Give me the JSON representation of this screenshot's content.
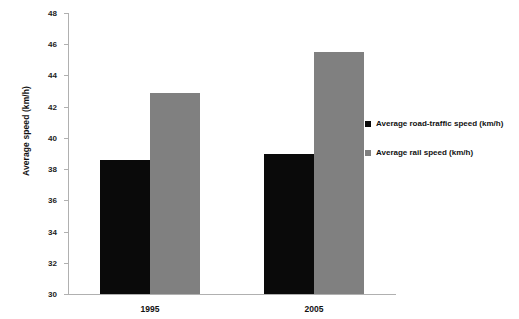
{
  "chart_data": {
    "type": "bar",
    "title": "",
    "xlabel": "",
    "ylabel": "Average speed (km/h)",
    "categories": [
      "1995",
      "2005"
    ],
    "series": [
      {
        "name": "Average road-traffic speed (km/h)",
        "color": "#0a0a0a",
        "values": [
          38.6,
          39.0
        ]
      },
      {
        "name": "Average rail speed (km/h)",
        "color": "#808080",
        "values": [
          42.9,
          45.5
        ]
      }
    ],
    "ylim": [
      30,
      48
    ],
    "ytick_step": 2,
    "yticks": [
      30,
      32,
      34,
      36,
      38,
      40,
      42,
      44,
      46,
      48
    ],
    "ytick_labels": [
      "30",
      "32",
      "34",
      "36",
      "38",
      "40",
      "42",
      "44",
      "46",
      "48"
    ],
    "grid": false,
    "legend_position": "right",
    "background_color": "#ffffff",
    "axis_color": "#b0b0b0"
  }
}
